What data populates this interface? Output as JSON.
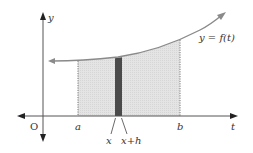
{
  "diagram": {
    "axes": {
      "vertical_label": "y",
      "horizontal_label": "t",
      "origin_label": "O"
    },
    "curve_label": "y = f(t)",
    "tick_labels": {
      "a": "a",
      "b": "b"
    },
    "strip_labels": {
      "left": "x",
      "right": "x+h"
    },
    "colors": {
      "axis": "#555555",
      "curve": "#8a8a8a",
      "region_fill": "#e2e2e2",
      "strip_fill": "#4a4a4a",
      "text": "#333333"
    }
  }
}
